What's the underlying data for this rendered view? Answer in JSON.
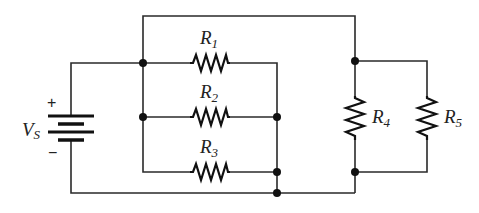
{
  "diagram": {
    "type": "circuit-schematic",
    "source": {
      "label": "V",
      "subscript": "S",
      "plus": "+",
      "minus": "−"
    },
    "resistors": [
      {
        "id": "R1",
        "label": "R",
        "subscript": "1"
      },
      {
        "id": "R2",
        "label": "R",
        "subscript": "2"
      },
      {
        "id": "R3",
        "label": "R",
        "subscript": "3"
      },
      {
        "id": "R4",
        "label": "R",
        "subscript": "4"
      },
      {
        "id": "R5",
        "label": "R",
        "subscript": "5"
      }
    ],
    "colors": {
      "wire": "#2a2a2a",
      "component": "#111111",
      "background": "#ffffff"
    }
  }
}
